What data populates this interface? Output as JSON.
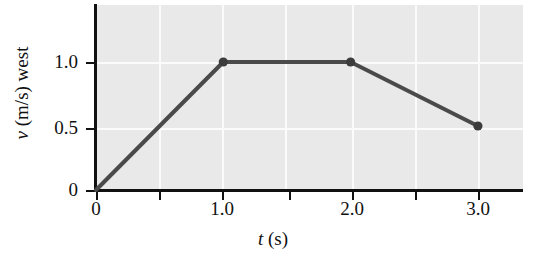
{
  "chart_data": {
    "type": "line",
    "title": "",
    "xlabel": "t (s)",
    "xlabel_symbol": "t",
    "xlabel_unit": "(s)",
    "ylabel": "v (m/s) west",
    "ylabel_symbol": "v",
    "ylabel_rest": "(m/s) west",
    "x": [
      0,
      1.0,
      2.0,
      3.0
    ],
    "values": [
      0,
      1.0,
      1.0,
      0.5
    ],
    "series": [
      {
        "name": "velocity",
        "points": [
          {
            "x": 0,
            "y": 0,
            "marker": false
          },
          {
            "x": 1.0,
            "y": 1.0,
            "marker": true
          },
          {
            "x": 2.0,
            "y": 1.0,
            "marker": true
          },
          {
            "x": 3.0,
            "y": 0.5,
            "marker": true
          }
        ]
      }
    ],
    "xlim": [
      0,
      3.37
    ],
    "ylim": [
      0,
      1.47
    ],
    "xticks": [
      0,
      0.5,
      1.0,
      1.5,
      2.0,
      2.5,
      3.0
    ],
    "xtick_labels": [
      "0",
      "",
      "1.0",
      "",
      "2.0",
      "",
      "3.0"
    ],
    "yticks": [
      0,
      0.5,
      1.0
    ],
    "ytick_labels": [
      "0",
      "0.5",
      "1.0"
    ],
    "grid": true,
    "grid_color": "#fbfbfb",
    "plot_bg": "#e9e9e9",
    "line_color": "#4a4a4a",
    "marker_color": "#3c3c3c",
    "axis_color": "#111111",
    "legend": null
  }
}
